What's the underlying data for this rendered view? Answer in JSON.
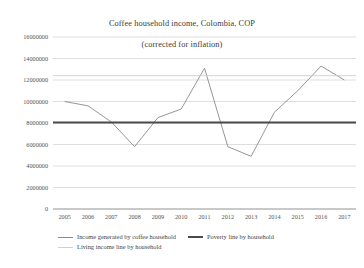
{
  "chart_data": {
    "type": "line",
    "title": "Coffee household income, Colombia, COP",
    "subtitle": "(corrected for inflation)",
    "xlabel": "",
    "ylabel": "",
    "grid": true,
    "legend_position": "bottom",
    "x": [
      2005,
      2006,
      2007,
      2008,
      2009,
      2010,
      2011,
      2012,
      2013,
      2014,
      2015,
      2016,
      2017
    ],
    "categories": [
      "2005",
      "2006",
      "2007",
      "2008",
      "2009",
      "2010",
      "2011",
      "2012",
      "2013",
      "2014",
      "2015",
      "2016",
      "2017"
    ],
    "ylim": [
      0,
      16000000
    ],
    "yticks": [
      0,
      2000000,
      4000000,
      6000000,
      8000000,
      10000000,
      12000000,
      14000000,
      16000000
    ],
    "ytick_labels": [
      "0",
      "2000000",
      "4000000",
      "6000000",
      "8000000",
      "10000000",
      "12000000",
      "14000000",
      "16000000"
    ],
    "series": [
      {
        "name": "Income generated by coffee household",
        "color": "#8a8a8a",
        "values": [
          10000000,
          9600000,
          8100000,
          5800000,
          8500000,
          9300000,
          13100000,
          5800000,
          4900000,
          9000000,
          11000000,
          13300000,
          12000000
        ]
      },
      {
        "name": "Poverty line by household",
        "color": "#4a4a4a",
        "values": [
          8050000,
          8050000,
          8050000,
          8050000,
          8050000,
          8050000,
          8050000,
          8050000,
          8050000,
          8050000,
          8050000,
          8050000,
          8050000
        ]
      },
      {
        "name": "Living income line by household",
        "color": "#cfcfcf",
        "values": [
          12400000,
          12400000,
          12400000,
          12400000,
          12400000,
          12400000,
          12400000,
          12400000,
          12400000,
          12400000,
          12400000,
          12400000,
          12400000
        ]
      }
    ]
  },
  "legend": {
    "items": [
      {
        "label": "Income generated by coffee household",
        "swatch": "swatch-income"
      },
      {
        "label": "Poverty line by household",
        "swatch": "swatch-poverty"
      },
      {
        "label": "Living income line by household",
        "swatch": "swatch-living"
      }
    ]
  },
  "colors": {
    "grid": "#d5d5d5",
    "axis": "#9a9a9a",
    "income_line": "#8a8a8a",
    "poverty_line": "#4a4a4a",
    "living_line": "#cfcfcf",
    "text": "#3b3b3b",
    "background": "#ffffff"
  }
}
